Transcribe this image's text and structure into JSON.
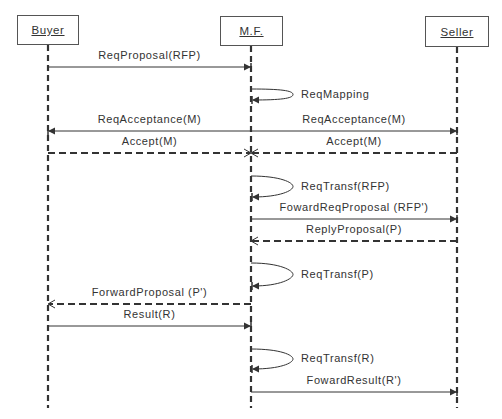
{
  "diagram": {
    "type": "sequence-diagram",
    "actors": [
      {
        "id": "buyer",
        "label": "Buyer",
        "x": 48,
        "box": [
          17,
          15,
          62,
          30
        ]
      },
      {
        "id": "mf",
        "label": "M.F.",
        "x": 251,
        "box": [
          220,
          16,
          63,
          30
        ]
      },
      {
        "id": "seller",
        "label": "Seller",
        "x": 457,
        "box": [
          425,
          16,
          64,
          31
        ]
      }
    ],
    "lifeline_end_y": 408,
    "messages": [
      {
        "from": "buyer",
        "to": "mf",
        "label": "ReqProposal(RFP)",
        "y": 67,
        "style": "solid"
      },
      {
        "from": "mf",
        "to": "mf",
        "label": "ReqMapping",
        "y": 89,
        "y2": 100,
        "style": "self"
      },
      {
        "from": "mf",
        "to": "buyer",
        "label": "ReqAcceptance(M)",
        "y": 131,
        "style": "solid"
      },
      {
        "from": "mf",
        "to": "seller",
        "label": "ReqAcceptance(M)",
        "y": 131,
        "style": "solid"
      },
      {
        "from": "buyer",
        "to": "mf",
        "label": "Accept(M)",
        "y": 153,
        "style": "dashed"
      },
      {
        "from": "seller",
        "to": "mf",
        "label": "Accept(M)",
        "y": 153,
        "style": "dashed"
      },
      {
        "from": "mf",
        "to": "mf",
        "label": "ReqTransf(RFP)",
        "y": 176,
        "y2": 197,
        "style": "self"
      },
      {
        "from": "mf",
        "to": "seller",
        "label": "FowardReqProposal (RFP')",
        "y": 219,
        "style": "solid"
      },
      {
        "from": "seller",
        "to": "mf",
        "label": "ReplyProposal(P)",
        "y": 241,
        "style": "dashed"
      },
      {
        "from": "mf",
        "to": "mf",
        "label": "ReqTransf(P)",
        "y": 263,
        "y2": 286,
        "style": "self"
      },
      {
        "from": "mf",
        "to": "buyer",
        "label": "ForwardProposal (P')",
        "y": 304,
        "style": "dashed"
      },
      {
        "from": "buyer",
        "to": "mf",
        "label": "Result(R)",
        "y": 326,
        "style": "solid"
      },
      {
        "from": "mf",
        "to": "mf",
        "label": "ReqTransf(R)",
        "y": 349,
        "y2": 369,
        "style": "self"
      },
      {
        "from": "mf",
        "to": "seller",
        "label": "FowardResult(R')",
        "y": 392,
        "style": "solid"
      }
    ]
  },
  "colors": {
    "line": "#333333",
    "box_border": "#555555",
    "text": "#333333",
    "background": "#ffffff"
  }
}
